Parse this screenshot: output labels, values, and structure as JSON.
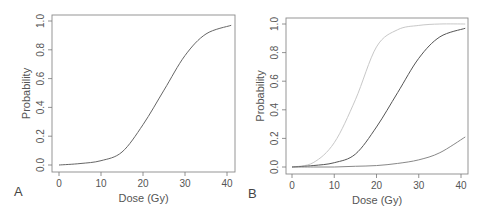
{
  "chart_data": [
    {
      "type": "line",
      "panel_label": "A",
      "xlabel": "Dose (Gy)",
      "ylabel": "Probability",
      "xlim": [
        0,
        41
      ],
      "ylim": [
        0,
        1.0
      ],
      "xticks": [
        0,
        10,
        20,
        30,
        40
      ],
      "yticks": [
        "0.0",
        "0.2",
        "0.4",
        "0.6",
        "0.8",
        "1.0"
      ],
      "grid": false,
      "legend": null,
      "series": [
        {
          "name": "dose-response",
          "color": "#666666",
          "x": [
            0,
            5,
            10,
            15,
            20,
            25,
            30,
            35,
            41
          ],
          "y": [
            0.0,
            0.01,
            0.03,
            0.09,
            0.28,
            0.52,
            0.76,
            0.91,
            0.97
          ]
        }
      ]
    },
    {
      "type": "line",
      "panel_label": "B",
      "xlabel": "Dose (Gy)",
      "ylabel": "Probability",
      "xlim": [
        0,
        41
      ],
      "ylim": [
        0,
        1.0
      ],
      "xticks": [
        0,
        10,
        20,
        30,
        40
      ],
      "yticks": [
        "0.0",
        "0.2",
        "0.4",
        "0.6",
        "0.8",
        "1.0"
      ],
      "grid": false,
      "legend": null,
      "series": [
        {
          "name": "light-curve",
          "color": "#c8c8c8",
          "x": [
            0,
            5,
            10,
            15,
            20,
            25,
            30,
            35,
            41
          ],
          "y": [
            0.0,
            0.03,
            0.17,
            0.47,
            0.84,
            0.96,
            0.99,
            1.0,
            1.0
          ]
        },
        {
          "name": "middle-curve",
          "color": "#555555",
          "x": [
            0,
            5,
            10,
            15,
            20,
            25,
            30,
            35,
            41
          ],
          "y": [
            0.0,
            0.01,
            0.03,
            0.09,
            0.28,
            0.52,
            0.76,
            0.91,
            0.97
          ]
        },
        {
          "name": "low-curve",
          "color": "#888888",
          "x": [
            0,
            5,
            10,
            15,
            20,
            25,
            30,
            35,
            41
          ],
          "y": [
            0.0,
            0.0,
            0.0,
            0.005,
            0.01,
            0.025,
            0.05,
            0.1,
            0.21
          ]
        }
      ]
    }
  ],
  "panels": [
    {
      "letter": "A",
      "xlabel": "Dose (Gy)",
      "ylabel": "Probability",
      "box": {
        "left": 52,
        "top": 15,
        "right": 235,
        "bottom": 172
      },
      "x0px": 59,
      "x40px": 227,
      "y0px": 165,
      "y1px": 21
    },
    {
      "letter": "B",
      "xlabel": "Dose (Gy)",
      "ylabel": "Probability",
      "box": {
        "left": 286,
        "top": 18,
        "right": 468,
        "bottom": 174
      },
      "x0px": 292,
      "x40px": 461,
      "y0px": 167,
      "y1px": 24
    }
  ]
}
